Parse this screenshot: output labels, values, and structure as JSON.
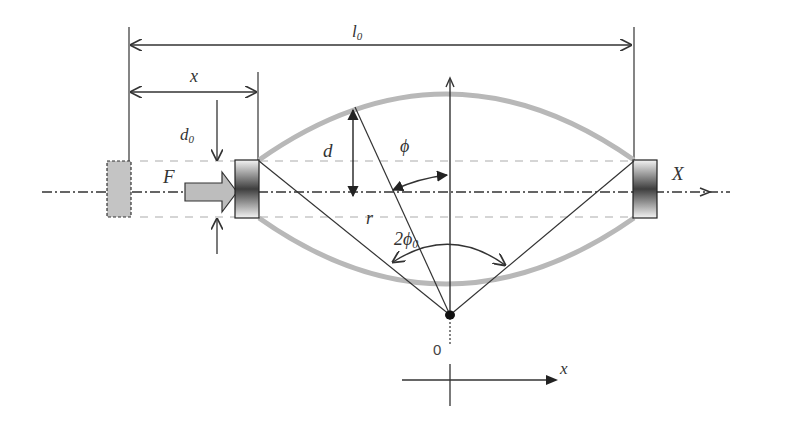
{
  "diagram": {
    "labels": {
      "l0": "l",
      "l0_sub": "0",
      "x_top": "x",
      "d0": "d",
      "d0_sub": "0",
      "d": "d",
      "phi": "ϕ",
      "F": "F",
      "X": "X",
      "r": "r",
      "two_phi0": "2ϕ",
      "two_phi0_sub": "0",
      "origin": "0",
      "x_axis": "x"
    },
    "colors": {
      "line": "#222222",
      "arc": "#b8b8b8",
      "dashed_guide": "#c8c8c8",
      "ghost_block": "#c4c4c4",
      "force_arrow": "#bdbdbd",
      "block_dark": "#444444",
      "block_light": "#f2f2f2"
    }
  }
}
